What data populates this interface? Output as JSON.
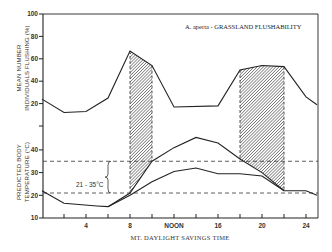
{
  "chart_data": {
    "type": "line",
    "title": "A. aperta - GRASSLAND FLUSHABILITY",
    "xlabel": "MT. DAYLIGHT SAVINGS TIME",
    "x_ticks": [
      {
        "hour": 4,
        "label": "4"
      },
      {
        "hour": 8,
        "label": "8"
      },
      {
        "hour": 12,
        "label": "NOON"
      },
      {
        "hour": 16,
        "label": "16"
      },
      {
        "hour": 20,
        "label": "20"
      },
      {
        "hour": 24,
        "label": "24"
      }
    ],
    "xlim": [
      0,
      25
    ],
    "panels": [
      {
        "name": "flushing",
        "ylabel_line1": "MEAN NUMBER",
        "ylabel_line2": "INDIVIDUALS FLUSHING (%)",
        "ylim": [
          0,
          100
        ],
        "y_ticks": [
          "20",
          "40",
          "60",
          "80",
          "100"
        ],
        "series": [
          {
            "name": "Mean % individuals flushing",
            "x": [
              0,
              2,
              4,
              6,
              8,
              10,
              12,
              16,
              18,
              20,
              22,
              24,
              25
            ],
            "values": [
              24,
              12,
              13,
              25,
              67,
              54,
              17,
              18,
              50,
              54,
              53,
              26,
              19
            ]
          }
        ]
      },
      {
        "name": "body-temperature",
        "ylabel_line1": "PREDICTED BODY",
        "ylabel_line2": "TEMPERATURE (°C)",
        "ylim": [
          10,
          40
        ],
        "y_ticks": [
          "10",
          "20",
          "30",
          "40"
        ],
        "series": [
          {
            "name": "Upper predicted body temperature",
            "x": [
              0,
              2,
              5,
              6,
              8,
              10,
              12,
              14,
              16,
              18,
              20,
              22,
              24,
              25
            ],
            "values": [
              22,
              16.5,
              15.3,
              15,
              21,
              35,
              41,
              45.5,
              43,
              36,
              30,
              22,
              22,
              20
            ]
          },
          {
            "name": "Lower predicted body temperature",
            "x": [
              6,
              8,
              10,
              12,
              14,
              16,
              18,
              20,
              22
            ],
            "values": [
              15,
              20,
              26,
              30.5,
              32,
              29.5,
              29.5,
              28.5,
              22
            ]
          }
        ],
        "reference_lines": [
          {
            "y": 21,
            "style": "dashed"
          },
          {
            "y": 35,
            "style": "dashed"
          }
        ],
        "annotation": "21 - 35°C"
      }
    ],
    "shaded_bands": [
      {
        "from_hour": 8,
        "to_hour": 10
      },
      {
        "from_hour": 18,
        "to_hour": 22
      }
    ],
    "grid": false,
    "legend": "none"
  }
}
